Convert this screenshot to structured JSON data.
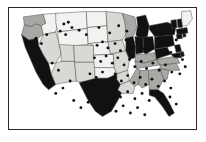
{
  "figure": {
    "background_color": "#ffffff",
    "frame_color": "#2a2a2a",
    "alt_title": "Choropleth map of the contiguous United States with point markers"
  },
  "chart_data": {
    "type": "map",
    "title": "",
    "subtitle": "",
    "xlabel": "",
    "ylabel": "",
    "projection": "contiguous-united-states",
    "grid": false,
    "legend_position": "none",
    "legend_entries": [],
    "annotations": [],
    "color_scale": {
      "type": "sequential-grayscale",
      "levels": [
        {
          "name": "lowest",
          "color": "#f2f2f0"
        },
        {
          "name": "low",
          "color": "#d8d8d4"
        },
        {
          "name": "medium",
          "color": "#a8a8a4"
        },
        {
          "name": "highest",
          "color": "#111111"
        }
      ]
    },
    "marker_style": {
      "shape": "circle",
      "color": "#111111",
      "radius_px": 1.6,
      "description": "black point markers indicating locations"
    },
    "regions": [
      {
        "name": "Washington",
        "abbr": "WA",
        "level": "medium",
        "color": "#a8a8a4"
      },
      {
        "name": "Oregon",
        "abbr": "OR",
        "level": "medium",
        "color": "#a8a8a4"
      },
      {
        "name": "California",
        "abbr": "CA",
        "level": "highest",
        "color": "#111111"
      },
      {
        "name": "Idaho",
        "abbr": "ID",
        "level": "lowest",
        "color": "#f2f2f0"
      },
      {
        "name": "Nevada",
        "abbr": "NV",
        "level": "low",
        "color": "#d8d8d4"
      },
      {
        "name": "Montana",
        "abbr": "MT",
        "level": "lowest",
        "color": "#f2f2f0"
      },
      {
        "name": "Wyoming",
        "abbr": "WY",
        "level": "lowest",
        "color": "#f2f2f0"
      },
      {
        "name": "Utah",
        "abbr": "UT",
        "level": "low",
        "color": "#d8d8d4"
      },
      {
        "name": "Arizona",
        "abbr": "AZ",
        "level": "low",
        "color": "#d8d8d4"
      },
      {
        "name": "Colorado",
        "abbr": "CO",
        "level": "low",
        "color": "#d8d8d4"
      },
      {
        "name": "New Mexico",
        "abbr": "NM",
        "level": "low",
        "color": "#d8d8d4"
      },
      {
        "name": "North Dakota",
        "abbr": "ND",
        "level": "lowest",
        "color": "#f2f2f0"
      },
      {
        "name": "South Dakota",
        "abbr": "SD",
        "level": "lowest",
        "color": "#f2f2f0"
      },
      {
        "name": "Nebraska",
        "abbr": "NE",
        "level": "lowest",
        "color": "#f2f2f0"
      },
      {
        "name": "Kansas",
        "abbr": "KS",
        "level": "lowest",
        "color": "#f2f2f0"
      },
      {
        "name": "Oklahoma",
        "abbr": "OK",
        "level": "lowest",
        "color": "#f2f2f0"
      },
      {
        "name": "Texas",
        "abbr": "TX",
        "level": "highest",
        "color": "#111111"
      },
      {
        "name": "Minnesota",
        "abbr": "MN",
        "level": "low",
        "color": "#d8d8d4"
      },
      {
        "name": "Iowa",
        "abbr": "IA",
        "level": "low",
        "color": "#d8d8d4"
      },
      {
        "name": "Missouri",
        "abbr": "MO",
        "level": "low",
        "color": "#d8d8d4"
      },
      {
        "name": "Arkansas",
        "abbr": "AR",
        "level": "low",
        "color": "#d8d8d4"
      },
      {
        "name": "Louisiana",
        "abbr": "LA",
        "level": "low",
        "color": "#d8d8d4"
      },
      {
        "name": "Wisconsin",
        "abbr": "WI",
        "level": "medium",
        "color": "#a8a8a4"
      },
      {
        "name": "Illinois",
        "abbr": "IL",
        "level": "highest",
        "color": "#111111"
      },
      {
        "name": "Michigan",
        "abbr": "MI",
        "level": "highest",
        "color": "#111111"
      },
      {
        "name": "Indiana",
        "abbr": "IN",
        "level": "highest",
        "color": "#111111"
      },
      {
        "name": "Ohio",
        "abbr": "OH",
        "level": "highest",
        "color": "#111111"
      },
      {
        "name": "Kentucky",
        "abbr": "KY",
        "level": "medium",
        "color": "#a8a8a4"
      },
      {
        "name": "Tennessee",
        "abbr": "TN",
        "level": "medium",
        "color": "#a8a8a4"
      },
      {
        "name": "Mississippi",
        "abbr": "MS",
        "level": "medium",
        "color": "#a8a8a4"
      },
      {
        "name": "Alabama",
        "abbr": "AL",
        "level": "medium",
        "color": "#a8a8a4"
      },
      {
        "name": "Georgia",
        "abbr": "GA",
        "level": "medium",
        "color": "#a8a8a4"
      },
      {
        "name": "Florida",
        "abbr": "FL",
        "level": "highest",
        "color": "#111111"
      },
      {
        "name": "South Carolina",
        "abbr": "SC",
        "level": "medium",
        "color": "#a8a8a4"
      },
      {
        "name": "North Carolina",
        "abbr": "NC",
        "level": "medium",
        "color": "#a8a8a4"
      },
      {
        "name": "Virginia",
        "abbr": "VA",
        "level": "medium",
        "color": "#a8a8a4"
      },
      {
        "name": "West Virginia",
        "abbr": "WV",
        "level": "highest",
        "color": "#111111"
      },
      {
        "name": "Pennsylvania",
        "abbr": "PA",
        "level": "highest",
        "color": "#111111"
      },
      {
        "name": "New York",
        "abbr": "NY",
        "level": "highest",
        "color": "#111111"
      },
      {
        "name": "Maryland",
        "abbr": "MD",
        "level": "highest",
        "color": "#111111"
      },
      {
        "name": "Delaware",
        "abbr": "DE",
        "level": "highest",
        "color": "#111111"
      },
      {
        "name": "New Jersey",
        "abbr": "NJ",
        "level": "highest",
        "color": "#111111"
      },
      {
        "name": "Connecticut",
        "abbr": "CT",
        "level": "highest",
        "color": "#111111"
      },
      {
        "name": "Rhode Island",
        "abbr": "RI",
        "level": "highest",
        "color": "#111111"
      },
      {
        "name": "Massachusetts",
        "abbr": "MA",
        "level": "highest",
        "color": "#111111"
      },
      {
        "name": "Vermont",
        "abbr": "VT",
        "level": "highest",
        "color": "#111111"
      },
      {
        "name": "New Hampshire",
        "abbr": "NH",
        "level": "highest",
        "color": "#111111"
      },
      {
        "name": "Maine",
        "abbr": "ME",
        "level": "lowest",
        "color": "#f2f2f0"
      }
    ],
    "points": [
      [
        61,
        18
      ],
      [
        66,
        16
      ],
      [
        70,
        22
      ],
      [
        57,
        26
      ],
      [
        63,
        30
      ],
      [
        78,
        25
      ],
      [
        86,
        30
      ],
      [
        100,
        22
      ],
      [
        112,
        28
      ],
      [
        122,
        20
      ],
      [
        131,
        26
      ],
      [
        148,
        31
      ],
      [
        160,
        24
      ],
      [
        170,
        30
      ],
      [
        186,
        36
      ],
      [
        98,
        42
      ],
      [
        104,
        38
      ],
      [
        110,
        45
      ],
      [
        118,
        40
      ],
      [
        124,
        48
      ],
      [
        130,
        36
      ],
      [
        136,
        44
      ],
      [
        142,
        38
      ],
      [
        150,
        46
      ],
      [
        156,
        40
      ],
      [
        164,
        48
      ],
      [
        172,
        42
      ],
      [
        180,
        50
      ],
      [
        188,
        44
      ],
      [
        95,
        56
      ],
      [
        102,
        60
      ],
      [
        108,
        54
      ],
      [
        115,
        62
      ],
      [
        121,
        56
      ],
      [
        128,
        64
      ],
      [
        134,
        58
      ],
      [
        140,
        66
      ],
      [
        147,
        60
      ],
      [
        153,
        68
      ],
      [
        160,
        62
      ],
      [
        167,
        70
      ],
      [
        174,
        64
      ],
      [
        181,
        72
      ],
      [
        90,
        74
      ],
      [
        97,
        78
      ],
      [
        104,
        72
      ],
      [
        111,
        80
      ],
      [
        118,
        74
      ],
      [
        125,
        82
      ],
      [
        132,
        76
      ],
      [
        139,
        84
      ],
      [
        146,
        78
      ],
      [
        152,
        86
      ],
      [
        159,
        80
      ],
      [
        166,
        88
      ],
      [
        173,
        82
      ],
      [
        180,
        90
      ],
      [
        100,
        94
      ],
      [
        108,
        98
      ],
      [
        116,
        92
      ],
      [
        124,
        100
      ],
      [
        132,
        94
      ],
      [
        140,
        102
      ],
      [
        148,
        96
      ],
      [
        156,
        104
      ],
      [
        164,
        98
      ],
      [
        172,
        106
      ],
      [
        179,
        100
      ],
      [
        186,
        108
      ],
      [
        95,
        110
      ],
      [
        103,
        114
      ],
      [
        111,
        108
      ],
      [
        119,
        116
      ],
      [
        127,
        110
      ],
      [
        135,
        118
      ],
      [
        143,
        112
      ],
      [
        151,
        120
      ],
      [
        30,
        34
      ],
      [
        36,
        40
      ],
      [
        42,
        30
      ],
      [
        26,
        46
      ],
      [
        48,
        62
      ],
      [
        55,
        70
      ],
      [
        38,
        76
      ],
      [
        45,
        84
      ],
      [
        60,
        90
      ],
      [
        52,
        96
      ],
      [
        68,
        82
      ],
      [
        72,
        104
      ],
      [
        80,
        112
      ],
      [
        88,
        106
      ],
      [
        193,
        58
      ],
      [
        196,
        66
      ],
      [
        190,
        74
      ]
    ]
  }
}
